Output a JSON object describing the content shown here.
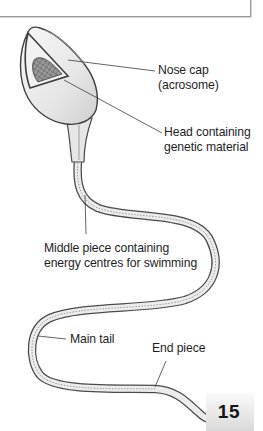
{
  "diagram": {
    "labels": {
      "nose_cap_line1": "Nose cap",
      "nose_cap_line2": "(acrosome)",
      "head_line1": "Head containing",
      "head_line2": "genetic material",
      "middle_line1": "Middle piece containing",
      "middle_line2": "energy centres for swimming",
      "main_tail": "Main tail",
      "end_piece": "End piece"
    },
    "parts": [
      {
        "name": "Nose cap (acrosome)"
      },
      {
        "name": "Head containing genetic material"
      },
      {
        "name": "Middle piece containing energy centres for swimming"
      },
      {
        "name": "Main tail"
      },
      {
        "name": "End piece"
      }
    ]
  },
  "page": {
    "number": "15"
  },
  "colors": {
    "outline": "#4a4a4a",
    "fill": "#e9e9e9",
    "leader_line": "#3c3c3c",
    "page_box_top": "#fafafa",
    "page_box_bottom": "#d9d9d9"
  }
}
